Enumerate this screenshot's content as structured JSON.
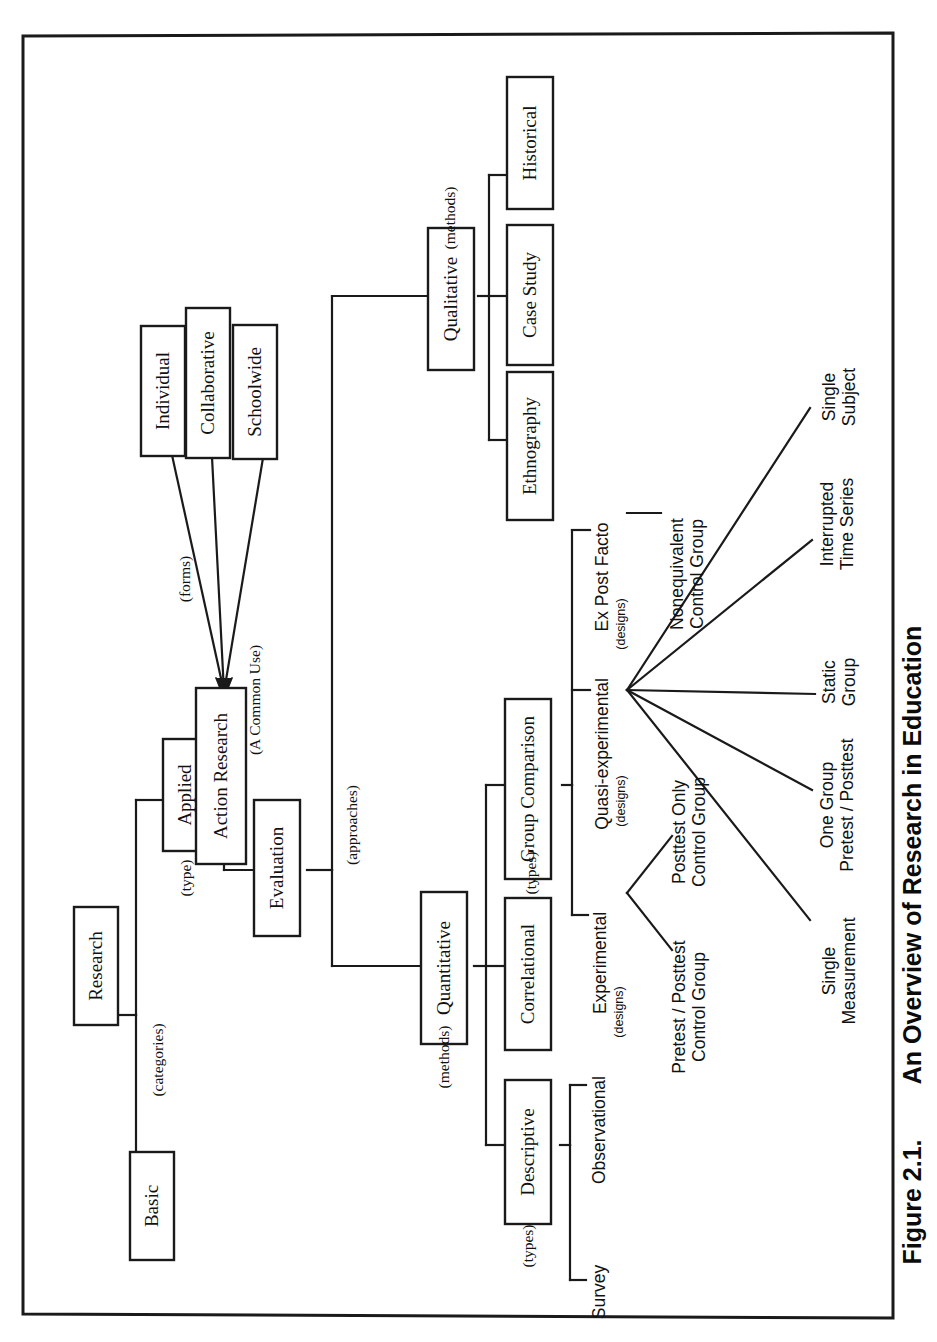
{
  "figure": {
    "caption_number": "Figure 2.1.",
    "caption_title": "An Overview of Research in Education",
    "orientation": "rotated-90-ccw",
    "frame_color": "#1a1a1a",
    "line_color": "#1a1a1a",
    "background": "#ffffff"
  },
  "nodes": {
    "research": "Research",
    "basic": "Basic",
    "applied": "Applied",
    "action_research": "Action Research",
    "evaluation": "Evaluation",
    "individual": "Individual",
    "collaborative": "Collaborative",
    "schoolwide": "Schoolwide",
    "qualitative": "Qualitative",
    "ethnography": "Ethnography",
    "case_study": "Case Study",
    "historical": "Historical",
    "quantitative": "Quantitative",
    "descriptive": "Descriptive",
    "correlational": "Correlational",
    "group_comparison": "Group Comparison",
    "survey": "Survey",
    "observational": "Observational",
    "experimental": "Experimental",
    "quasi_experimental": "Quasi-experimental",
    "ex_post_facto": "Ex Post Facto",
    "pretest_posttest_control_group": "Pretest / Posttest\nControl Group",
    "posttest_only_control_group": "Posttest Only\nControl Group",
    "nonequivalent_control_group": "Nonequivalent\nControl Group",
    "single_measurement": "Single\nMeasurement",
    "one_group_pretest_posttest": "One Group\nPretest / Posttest",
    "static_group": "Static\nGroup",
    "interrupted_time_series": "Interrupted\nTime Series",
    "single_subject": "Single\nSubject"
  },
  "edge_labels": {
    "categories": "(categories)",
    "type": "(type)",
    "a_common_use": "(A Common Use)",
    "forms": "(forms)",
    "approaches": "(approaches)",
    "methods_qual": "(methods)",
    "methods_quant": "(methods)",
    "types_descriptive": "(types)",
    "types_group_comparison": "(types)",
    "designs_experimental": "(designs)",
    "designs_quasi": "(designs)",
    "designs_ex_post_facto": "(designs)"
  },
  "hierarchy": {
    "root": "Research",
    "categories": [
      "Basic",
      "Applied"
    ],
    "applied_type": [
      "Action Research",
      "Evaluation"
    ],
    "action_research_forms": [
      "Individual",
      "Collaborative",
      "Schoolwide"
    ],
    "approaches": [
      "Quantitative",
      "Qualitative"
    ],
    "qualitative_methods": [
      "Ethnography",
      "Case Study",
      "Historical"
    ],
    "quantitative_methods": [
      "Descriptive",
      "Correlational",
      "Group Comparison"
    ],
    "descriptive_types": [
      "Survey",
      "Observational"
    ],
    "group_comparison_types": [
      "Experimental",
      "Quasi-experimental",
      "Ex Post Facto"
    ],
    "experimental_designs": [
      "Pretest / Posttest Control Group",
      "Posttest Only Control Group"
    ],
    "quasi_experimental_designs": [
      "Single Measurement",
      "One Group Pretest / Posttest",
      "Static Group",
      "Interrupted Time Series",
      "Single Subject"
    ],
    "ex_post_facto_designs": [
      "Nonequivalent Control Group"
    ]
  }
}
